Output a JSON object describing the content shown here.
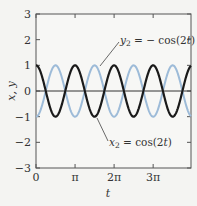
{
  "chart_data": {
    "type": "line",
    "title": "",
    "xlabel": "t",
    "ylabel": "x, y",
    "xlim": [
      0,
      12.47
    ],
    "ylim": [
      -3,
      3
    ],
    "grid": false,
    "x_ticks": [
      {
        "value": 0,
        "label": "0"
      },
      {
        "value": 3.1416,
        "label": "π"
      },
      {
        "value": 6.2832,
        "label": "2π"
      },
      {
        "value": 9.4248,
        "label": "3π"
      }
    ],
    "y_ticks": [
      {
        "value": 3,
        "label": "3"
      },
      {
        "value": 2,
        "label": "2"
      },
      {
        "value": 1,
        "label": "1"
      },
      {
        "value": 0,
        "label": "0"
      },
      {
        "value": -1,
        "label": "−1"
      },
      {
        "value": -2,
        "label": "−2"
      },
      {
        "value": -3,
        "label": "−3"
      }
    ],
    "series": [
      {
        "name": "x2 = cos(2t)",
        "expression": "cos(2t)",
        "color": "#1a1a1a",
        "amplitude": 1,
        "angular_frequency": 2,
        "phase_sign": 1
      },
      {
        "name": "y2 = −cos(2t)",
        "expression": "-cos(2t)",
        "color": "#9dbbd8",
        "amplitude": 1,
        "angular_frequency": 2,
        "phase_sign": -1
      }
    ],
    "reference_lines": [
      {
        "axis": "y",
        "value": 0,
        "color": "#333333"
      }
    ],
    "annotations": [
      {
        "text_main": "y",
        "sub": "2",
        "rest": " = − cos(2",
        "ital": "t",
        "close": ")",
        "target_series": 1
      },
      {
        "text_main": "x",
        "sub": "2",
        "rest": " = cos(2",
        "ital": "t",
        "close": ")",
        "target_series": 0
      }
    ]
  }
}
